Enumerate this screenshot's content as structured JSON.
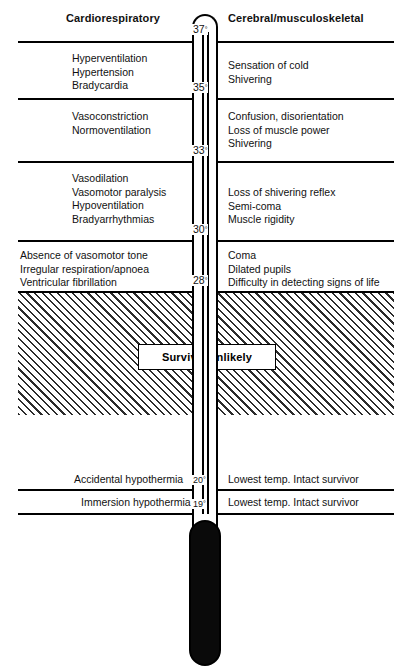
{
  "diagram": {
    "columns": {
      "left_header": "Cardiorespiratory",
      "right_header": "Cerebral/musculoskeletal"
    },
    "survival_label": "Survival unlikely",
    "temperature_marks": [
      {
        "value": "37",
        "unit": "°"
      },
      {
        "value": "35",
        "unit": "°"
      },
      {
        "value": "33",
        "unit": "°"
      },
      {
        "value": "30",
        "unit": "°"
      },
      {
        "value": "28",
        "unit": "°"
      },
      {
        "value": "20",
        "unit": "°"
      },
      {
        "value": "19",
        "unit": "°"
      }
    ],
    "bands": [
      {
        "range": "37°-35°",
        "left": [
          "Hyperventilation",
          "Hypertension",
          "Bradycardia"
        ],
        "right": [
          "Sensation of cold",
          "Shivering"
        ]
      },
      {
        "range": "35°-33°",
        "left": [
          "Vasoconstriction",
          "Normoventilation"
        ],
        "right": [
          "Confusion, disorientation",
          "Loss of muscle power",
          "Shivering"
        ]
      },
      {
        "range": "33°-30°",
        "left": [
          "Vasodilation",
          "Vasomotor paralysis",
          "Hypoventilation",
          "Bradyarrhythmias"
        ],
        "right": [
          "Loss of shivering reflex",
          "Semi-coma",
          "Muscle rigidity"
        ]
      },
      {
        "range": "30°-28°",
        "left": [
          "Absence of vasomotor tone",
          "Irregular respiration/apnoea",
          "Ventricular fibrillation"
        ],
        "right": [
          "Coma",
          "Dilated pupils",
          "Difficulty in detecting signs of life"
        ]
      }
    ],
    "footer_rows": [
      {
        "left": "Accidental hypothermia",
        "temp": "20",
        "right": "Lowest temp. Intact survivor"
      },
      {
        "left": "Immersion hypothermia",
        "temp": "19",
        "right": "Lowest temp. Intact survivor"
      }
    ],
    "colors": {
      "ink": "#000000",
      "paper": "#ffffff",
      "hatch": "#2b2b2b",
      "bulb": "#0a0a0a"
    }
  }
}
